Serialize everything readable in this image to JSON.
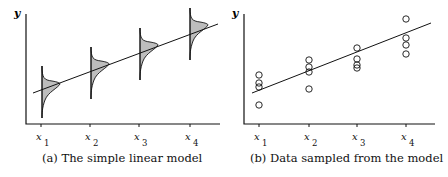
{
  "panels": [
    {
      "caption": "(a)  The simple linear model",
      "ylabel": "y",
      "xticks": [
        {
          "var": "x",
          "sub": "1"
        },
        {
          "var": "x",
          "sub": "2"
        },
        {
          "var": "x",
          "sub": "3"
        },
        {
          "var": "x",
          "sub": "4"
        }
      ]
    },
    {
      "caption": "(b)  Data sampled from the model",
      "ylabel": "y",
      "xticks": [
        {
          "var": "x",
          "sub": "1"
        },
        {
          "var": "x",
          "sub": "2"
        },
        {
          "var": "x",
          "sub": "3"
        },
        {
          "var": "x",
          "sub": "4"
        }
      ]
    }
  ],
  "colors": {
    "ink": "#111111",
    "fill": "#bdbdbd"
  }
}
